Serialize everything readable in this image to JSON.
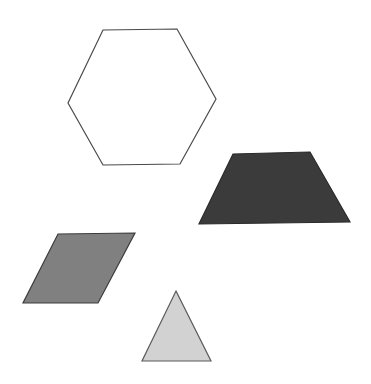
{
  "canvas": {
    "width": 371,
    "height": 384,
    "background_color": "#ffffff",
    "title": "Geometric Shapes"
  },
  "shapes": [
    {
      "id": "hexagon",
      "name": "hexagon",
      "label": "Hexagon",
      "sides": 6,
      "fill_color": "#ffffff",
      "stroke_color": "#4a4a4a",
      "stroke_width": 1.2,
      "fill_tone": "white",
      "points": "103,30 177,29 216,99 180,164 103,165 68,103",
      "centroid": {
        "x": 141,
        "y": 97
      },
      "bbox": {
        "x": 68,
        "y": 29,
        "width": 148,
        "height": 136
      }
    },
    {
      "id": "trapezoid",
      "name": "trapezoid",
      "label": "Trapezoid",
      "sides": 4,
      "fill_color": "#3b3b3b",
      "stroke_color": "#2a2a2a",
      "stroke_width": 1.2,
      "fill_tone": "dark gray",
      "points": "233,154 310,152 350,222 199,224",
      "centroid": {
        "x": 273,
        "y": 188
      },
      "bbox": {
        "x": 199,
        "y": 152,
        "width": 151,
        "height": 72
      }
    },
    {
      "id": "parallelogram",
      "name": "parallelogram",
      "label": "Parallelogram",
      "sides": 4,
      "fill_color": "#808080",
      "stroke_color": "#3c3c3c",
      "stroke_width": 1.2,
      "fill_tone": "medium gray",
      "points": "58,234 135,233 98,303 23,303",
      "centroid": {
        "x": 78,
        "y": 268
      },
      "bbox": {
        "x": 23,
        "y": 233,
        "width": 112,
        "height": 70
      }
    },
    {
      "id": "triangle",
      "name": "triangle",
      "label": "Triangle",
      "sides": 3,
      "fill_color": "#d2d2d2",
      "stroke_color": "#5a5a5a",
      "stroke_width": 1.2,
      "fill_tone": "light gray",
      "points": "176,291 211,361 142,361",
      "centroid": {
        "x": 176,
        "y": 338
      },
      "bbox": {
        "x": 142,
        "y": 291,
        "width": 69,
        "height": 70
      }
    }
  ]
}
